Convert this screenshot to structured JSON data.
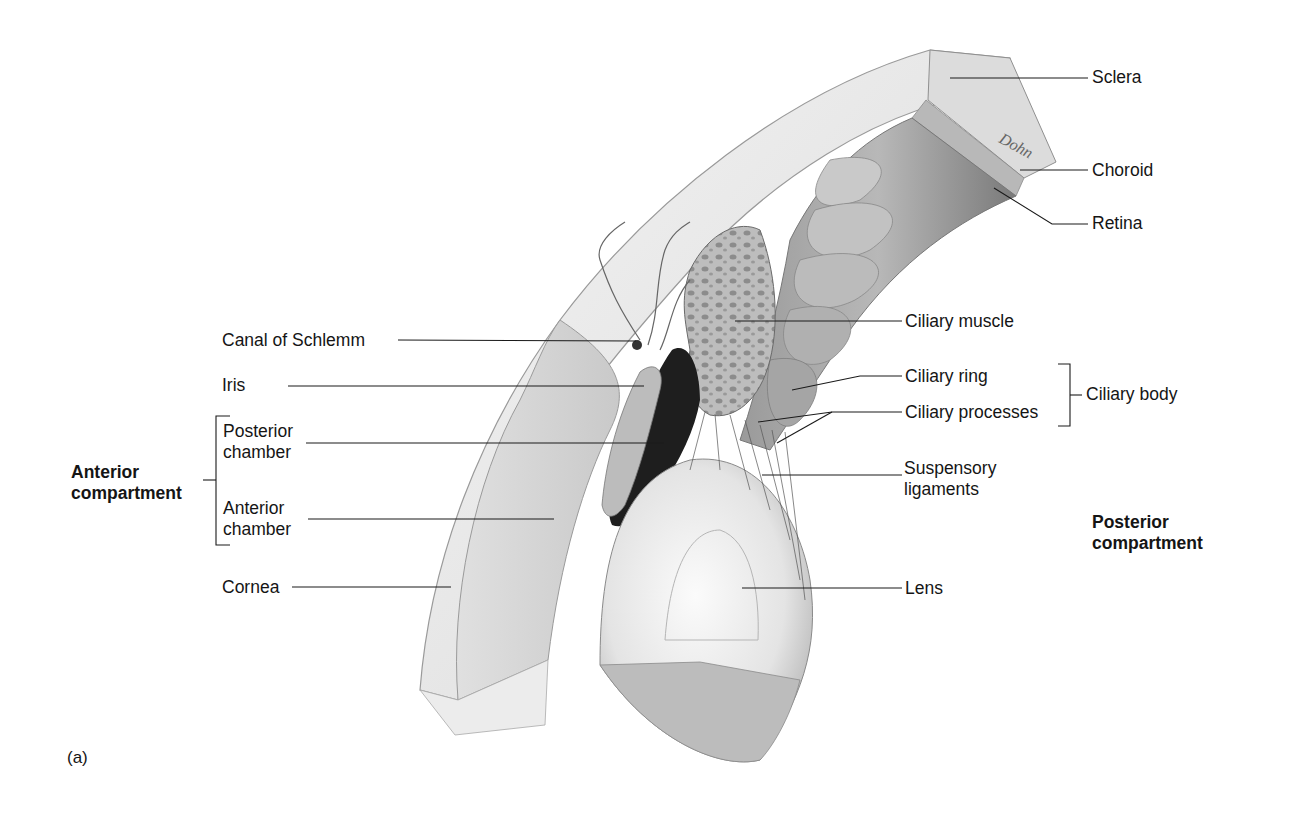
{
  "figure": {
    "panel_label": "(a)"
  },
  "labels": {
    "sclera": "Sclera",
    "choroid": "Choroid",
    "retina": "Retina",
    "ciliary_muscle": "Ciliary muscle",
    "canal_of_schlemm": "Canal of Schlemm",
    "iris": "Iris",
    "ciliary_ring": "Ciliary ring",
    "ciliary_processes": "Ciliary processes",
    "ciliary_body": "Ciliary body",
    "posterior_chamber_1": "Posterior",
    "posterior_chamber_2": "chamber",
    "anterior_chamber_1": "Anterior",
    "anterior_chamber_2": "chamber",
    "suspensory_ligaments_1": "Suspensory",
    "suspensory_ligaments_2": "ligaments",
    "anterior_compartment_1": "Anterior",
    "anterior_compartment_2": "compartment",
    "posterior_compartment_1": "Posterior",
    "posterior_compartment_2": "compartment",
    "cornea": "Cornea",
    "lens": "Lens",
    "signature": "Dohn"
  },
  "colors": {
    "line": "#1a1a1a",
    "sclera": "#e6e6e6",
    "tissue_light": "#d4d4d4",
    "tissue_mid": "#a8a8a8",
    "tissue_dark": "#6e6e6e",
    "pupil_dark": "#1c1c1c",
    "background": "#ffffff"
  }
}
